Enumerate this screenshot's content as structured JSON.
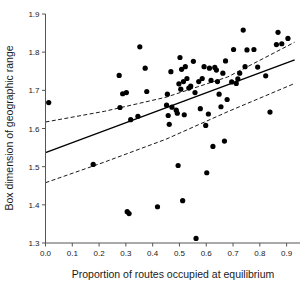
{
  "chart_data": {
    "type": "scatter",
    "title": "",
    "xlabel": "Proportion of routes occupied at equilibrium",
    "ylabel": "Box dimension of geographic range",
    "xlim": [
      0.0,
      0.95
    ],
    "ylim": [
      1.3,
      1.9
    ],
    "grid": false,
    "legend": "none",
    "xticks": [
      0.0,
      0.1,
      0.2,
      0.3,
      0.4,
      0.5,
      0.6,
      0.7,
      0.8,
      0.9
    ],
    "xtick_labels": [
      "0.0",
      "0.1",
      "0.2",
      "0.3",
      "0.4",
      "0.5",
      "0.6",
      "0.7",
      "0.8",
      "0.9"
    ],
    "yticks": [
      1.3,
      1.4,
      1.5,
      1.6,
      1.7,
      1.8,
      1.9
    ],
    "ytick_labels": [
      "1.3",
      "1.4",
      "1.5",
      "1.6",
      "1.7",
      "1.8",
      "1.9"
    ],
    "points": [
      [
        0.012,
        1.668
      ],
      [
        0.178,
        1.506
      ],
      [
        0.275,
        1.739
      ],
      [
        0.278,
        1.655
      ],
      [
        0.288,
        1.691
      ],
      [
        0.302,
        1.694
      ],
      [
        0.305,
        1.382
      ],
      [
        0.312,
        1.377
      ],
      [
        0.318,
        1.623
      ],
      [
        0.345,
        1.632
      ],
      [
        0.352,
        1.814
      ],
      [
        0.372,
        1.758
      ],
      [
        0.378,
        1.697
      ],
      [
        0.418,
        1.395
      ],
      [
        0.452,
        1.661
      ],
      [
        0.455,
        1.69
      ],
      [
        0.458,
        1.634
      ],
      [
        0.462,
        1.611
      ],
      [
        0.468,
        1.749
      ],
      [
        0.472,
        1.656
      ],
      [
        0.488,
        1.648
      ],
      [
        0.492,
        1.64
      ],
      [
        0.495,
        1.503
      ],
      [
        0.498,
        1.717
      ],
      [
        0.502,
        1.786
      ],
      [
        0.505,
        1.703
      ],
      [
        0.508,
        1.755
      ],
      [
        0.512,
        1.411
      ],
      [
        0.515,
        1.723
      ],
      [
        0.518,
        1.636
      ],
      [
        0.522,
        1.762
      ],
      [
        0.528,
        1.731
      ],
      [
        0.535,
        1.706
      ],
      [
        0.542,
        1.711
      ],
      [
        0.552,
        1.776
      ],
      [
        0.558,
        1.694
      ],
      [
        0.562,
        1.312
      ],
      [
        0.572,
        1.723
      ],
      [
        0.578,
        1.652
      ],
      [
        0.585,
        1.731
      ],
      [
        0.592,
        1.762
      ],
      [
        0.598,
        1.608
      ],
      [
        0.602,
        1.484
      ],
      [
        0.608,
        1.638
      ],
      [
        0.612,
        1.758
      ],
      [
        0.618,
        1.726
      ],
      [
        0.625,
        1.553
      ],
      [
        0.632,
        1.76
      ],
      [
        0.638,
        1.753
      ],
      [
        0.642,
        1.723
      ],
      [
        0.648,
        1.69
      ],
      [
        0.655,
        1.657
      ],
      [
        0.662,
        1.745
      ],
      [
        0.668,
        1.567
      ],
      [
        0.672,
        1.777
      ],
      [
        0.678,
        1.676
      ],
      [
        0.695,
        1.722
      ],
      [
        0.702,
        1.807
      ],
      [
        0.712,
        1.718
      ],
      [
        0.718,
        1.73
      ],
      [
        0.725,
        1.745
      ],
      [
        0.738,
        1.858
      ],
      [
        0.745,
        1.762
      ],
      [
        0.752,
        1.806
      ],
      [
        0.778,
        1.807
      ],
      [
        0.792,
        1.761
      ],
      [
        0.822,
        1.738
      ],
      [
        0.838,
        1.643
      ],
      [
        0.862,
        1.82
      ],
      [
        0.868,
        1.852
      ],
      [
        0.882,
        1.822
      ],
      [
        0.905,
        1.836
      ]
    ],
    "regression_line": {
      "label": "least-squares fit",
      "style": "solid",
      "x": [
        0.0,
        0.93
      ],
      "y": [
        1.537,
        1.78
      ]
    },
    "confidence_bands": [
      {
        "label": "upper confidence limit",
        "style": "dashed",
        "x": [
          0.0,
          0.22,
          0.45,
          0.68,
          0.93
        ],
        "y": [
          1.617,
          1.645,
          1.682,
          1.735,
          1.826
        ]
      },
      {
        "label": "lower confidence limit",
        "style": "dashed",
        "x": [
          0.0,
          0.22,
          0.45,
          0.68,
          0.93
        ],
        "y": [
          1.458,
          1.512,
          1.572,
          1.644,
          1.718
        ]
      }
    ]
  },
  "axes": {
    "x_label": "Proportion of routes occupied at equilibrium",
    "y_label": "Box dimension of geographic range"
  }
}
